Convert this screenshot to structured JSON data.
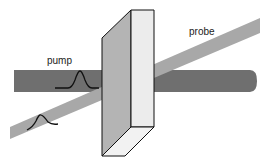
{
  "labels": {
    "pump": "pump",
    "probe": "probe"
  },
  "colors": {
    "pump_beam": "#6f6f6f",
    "probe_beam": "#a8a8a8",
    "sample_side": "#b4b4b4",
    "sample_front": "#ececec",
    "outline": "#111111"
  },
  "elements": [
    "pump beam",
    "probe beam",
    "sample slab",
    "pump pulse",
    "probe pulse"
  ]
}
